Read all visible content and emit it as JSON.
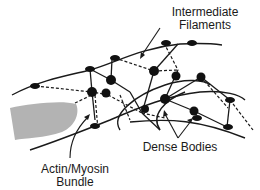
{
  "diagram": {
    "labels": {
      "intermediate_filaments_line1": "Intermediate",
      "intermediate_filaments_line2": "Filaments",
      "actin_myosin_line1": "Actin/Myosin",
      "actin_myosin_line2": "Bundle",
      "dense_bodies": "Dense Bodies"
    },
    "colors": {
      "line": "#1a1a1a",
      "nucleus_fill": "#b3b3b3",
      "node": "#111111",
      "background": "#ffffff"
    }
  }
}
